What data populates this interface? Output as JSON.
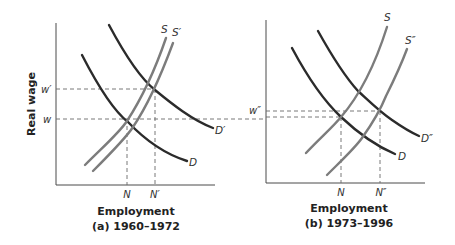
{
  "y_axis_label": "Real wage",
  "panels": [
    {
      "id": "a",
      "x_axis_label": "Employment",
      "caption": "(a) 1960–1972",
      "wage_labels": [
        "w′",
        "w"
      ],
      "employment_labels": [
        "N",
        "N′"
      ],
      "curves": {
        "supply": [
          "S",
          "S′"
        ],
        "demand": [
          "D",
          "D′"
        ]
      }
    },
    {
      "id": "b",
      "x_axis_label": "Employment",
      "caption": "(b) 1973–1996",
      "wage_labels": [
        "w″"
      ],
      "employment_labels": [
        "N",
        "N″"
      ],
      "curves": {
        "supply": [
          "S",
          "S″"
        ],
        "demand": [
          "D",
          "D″"
        ]
      }
    }
  ],
  "colors": {
    "demand": "#2b2b2b",
    "supply": "#7c7c7c",
    "guides": "#6a6a6a"
  }
}
